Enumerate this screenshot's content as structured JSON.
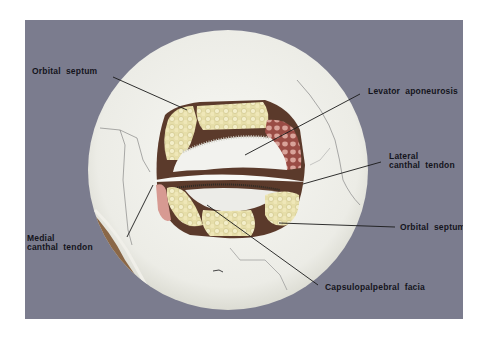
{
  "figure": {
    "colors": {
      "background_panel": "#7b7c8e",
      "skull": "#f1f1ec",
      "fat": "#e9e2b0",
      "muscle": "#a5564f",
      "cavity": "#5a3a2a",
      "label_text": "#14141c",
      "leader_line": "#1a1a1a"
    },
    "labels": [
      {
        "id": "orbital-septum-upper",
        "text": "Orbital  septum"
      },
      {
        "id": "levator-aponeurosis",
        "text": "Levator  aponeurosis"
      },
      {
        "id": "lateral-canthal-tendon",
        "text": "Lateral\ncanthal  tendon"
      },
      {
        "id": "medial-canthal-tendon",
        "text": "Medial\ncanthal  tendon"
      },
      {
        "id": "orbital-septum-lower",
        "text": "Orbital  septum"
      },
      {
        "id": "capsulopalpebral-facia",
        "text": "Capsulopalpebral  facia"
      }
    ]
  }
}
